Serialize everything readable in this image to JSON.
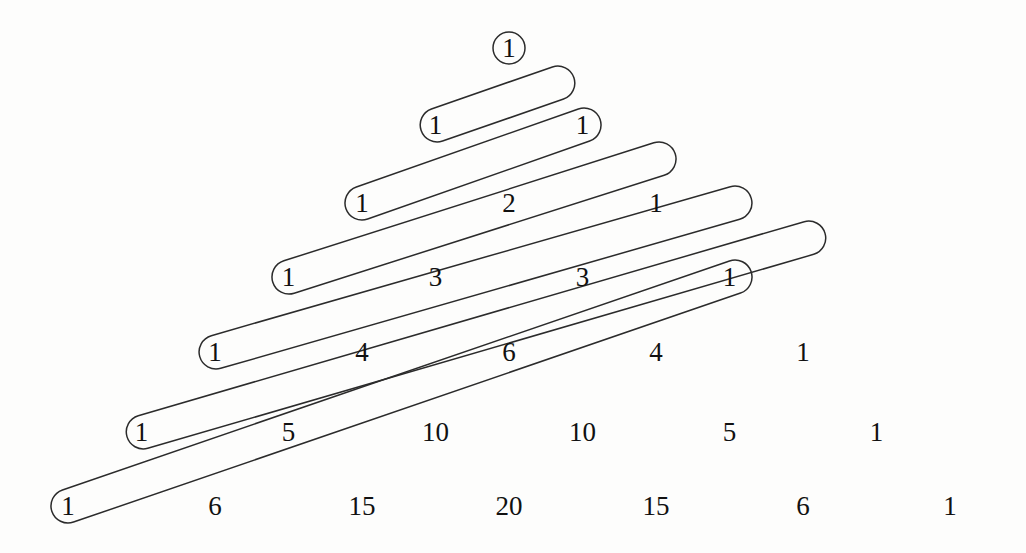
{
  "figure": {
    "name": "pascals-triangle-with-diagonal-capsules",
    "background_color": "#fdfdfc",
    "stroke_color": "#2b2b2b",
    "text_color": "#111111"
  },
  "chart_data": {
    "type": "table",
    "title": "",
    "subtitle": "",
    "xlabel": "",
    "ylabel": "",
    "grid": false,
    "legend": null,
    "rows": [
      {
        "row_index": 0,
        "values": [
          1
        ]
      },
      {
        "row_index": 1,
        "values": [
          1,
          1
        ]
      },
      {
        "row_index": 2,
        "values": [
          1,
          2,
          1
        ]
      },
      {
        "row_index": 3,
        "values": [
          1,
          3,
          3,
          1
        ]
      },
      {
        "row_index": 4,
        "values": [
          1,
          4,
          6,
          4,
          1
        ]
      },
      {
        "row_index": 5,
        "values": [
          1,
          5,
          10,
          10,
          5,
          1
        ]
      },
      {
        "row_index": 6,
        "values": [
          1,
          6,
          15,
          20,
          15,
          6,
          1
        ]
      }
    ],
    "row_y": [
      48,
      125,
      203,
      277,
      352,
      432,
      506
    ],
    "col_spacing": 147,
    "apex_x": 509,
    "annotations": {
      "apex_circle": {
        "shape": "circle",
        "label": "1",
        "cx": 509,
        "cy": 48,
        "r": 16
      },
      "capsules": [
        {
          "id": 1,
          "label_start": "1",
          "label_end": "1",
          "start_row": 1,
          "start_col": 0,
          "end_row": 0,
          "end_col": 0,
          "x1": 437,
          "y1": 125,
          "x2": 558,
          "y2": 83
        },
        {
          "id": 2,
          "label_start": "1",
          "label_end": "1",
          "start_row": 2,
          "start_col": 0,
          "end_row": 1,
          "end_col": 1,
          "x1": 362,
          "y1": 203,
          "x2": 584,
          "y2": 125
        },
        {
          "id": 3,
          "label_start": "1",
          "label_end": "1",
          "start_row": 3,
          "start_col": 0,
          "end_row": 2,
          "end_col": 2,
          "x1": 289,
          "y1": 277,
          "x2": 659,
          "y2": 159
        },
        {
          "id": 4,
          "label_start": "1",
          "label_end": "1",
          "start_row": 4,
          "start_col": 0,
          "end_row": 3,
          "end_col": 3,
          "x1": 216,
          "y1": 352,
          "x2": 735,
          "y2": 203
        },
        {
          "id": 5,
          "label_start": "1",
          "label_end": "1",
          "start_row": 5,
          "start_col": 0,
          "end_row": 4,
          "end_col": 4,
          "x1": 143,
          "y1": 432,
          "x2": 809,
          "y2": 238
        },
        {
          "id": 6,
          "label_start": "1",
          "label_end": "1",
          "start_row": 6,
          "start_col": 0,
          "end_row": 5,
          "end_col": 5,
          "x1": 68,
          "y1": 506,
          "x2": 735,
          "y2": 277
        }
      ],
      "capsule_half_width": 17
    }
  }
}
